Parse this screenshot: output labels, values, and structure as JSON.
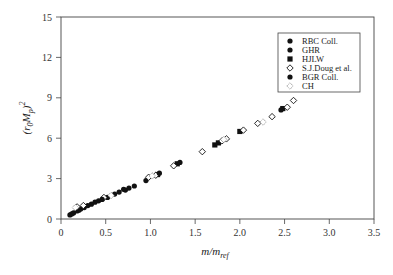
{
  "chart_data": {
    "type": "scatter",
    "title": "",
    "xlabel": "m/m_ref",
    "ylabel": "(r0 Mp)^2",
    "xlim": [
      0,
      3.5
    ],
    "ylim": [
      0,
      15
    ],
    "x_ticks": [
      "0",
      "0.5",
      "1.0",
      "1.5",
      "2.0",
      "2.5",
      "3.0",
      "3.5"
    ],
    "y_ticks": [
      "0",
      "3",
      "6",
      "9",
      "12",
      "15"
    ],
    "grid": false,
    "legend_position": "upper right",
    "series": [
      {
        "name": "RBC Coll.",
        "marker": "filled-circle",
        "color": "#111111",
        "points": [
          [
            0.1,
            0.3
          ],
          [
            0.14,
            0.45
          ],
          [
            0.18,
            0.6
          ],
          [
            0.22,
            0.75
          ],
          [
            0.3,
            1.0
          ],
          [
            0.42,
            1.35
          ],
          [
            0.6,
            1.85
          ],
          [
            0.72,
            2.15
          ],
          [
            0.82,
            2.45
          ],
          [
            0.95,
            2.85
          ]
        ]
      },
      {
        "name": "GHR",
        "marker": "filled-circle",
        "color": "#111111",
        "points": [
          [
            0.12,
            0.38
          ],
          [
            0.2,
            0.65
          ],
          [
            0.26,
            0.85
          ],
          [
            0.38,
            1.25
          ],
          [
            0.52,
            1.6
          ],
          [
            0.65,
            2.0
          ],
          [
            0.76,
            2.3
          ]
        ]
      },
      {
        "name": "HJLW",
        "marker": "filled-square",
        "color": "#111111",
        "points": [
          [
            1.08,
            3.3
          ],
          [
            1.3,
            4.1
          ],
          [
            1.72,
            5.5
          ],
          [
            1.76,
            5.65
          ],
          [
            2.0,
            6.5
          ],
          [
            2.48,
            8.2
          ]
        ]
      },
      {
        "name": "S.J.Doug et al.",
        "marker": "open-diamond",
        "color": "#111111",
        "points": [
          [
            0.18,
            0.9
          ],
          [
            0.25,
            1.0
          ],
          [
            0.48,
            1.6
          ],
          [
            0.98,
            3.1
          ],
          [
            1.06,
            3.25
          ],
          [
            1.26,
            3.95
          ],
          [
            1.58,
            5.0
          ],
          [
            1.8,
            5.8
          ],
          [
            1.85,
            5.95
          ],
          [
            2.04,
            6.6
          ],
          [
            2.2,
            7.1
          ],
          [
            2.36,
            7.6
          ],
          [
            2.53,
            8.3
          ],
          [
            2.6,
            8.8
          ]
        ]
      },
      {
        "name": "BGR Coll.",
        "marker": "filled-circle",
        "color": "#111111",
        "points": [
          [
            0.34,
            1.1
          ],
          [
            0.46,
            1.45
          ],
          [
            0.7,
            2.2
          ],
          [
            1.1,
            3.4
          ],
          [
            1.33,
            4.2
          ],
          [
            2.46,
            8.1
          ]
        ]
      },
      {
        "name": "CH",
        "marker": "open-diamond-dotted",
        "color": "#777777",
        "points": [
          [
            0.16,
            0.85
          ],
          [
            0.56,
            1.75
          ],
          [
            1.02,
            3.2
          ],
          [
            1.82,
            5.9
          ],
          [
            2.26,
            7.2
          ]
        ]
      }
    ]
  },
  "legend": {
    "items": [
      {
        "label": "RBC Coll.",
        "marker": "filled-circle"
      },
      {
        "label": "GHR",
        "marker": "filled-circle"
      },
      {
        "label": "HJLW",
        "marker": "filled-square"
      },
      {
        "label": "S.J.Doug et al.",
        "marker": "open-diamond"
      },
      {
        "label": "BGR Coll.",
        "marker": "filled-circle"
      },
      {
        "label": "CH",
        "marker": "open-diamond-dotted"
      }
    ]
  },
  "axes": {
    "x_title_main": "m/m",
    "x_title_sub": "ref",
    "y_title_main": "(r",
    "y_title_sub0": "0",
    "y_title_mid": "M",
    "y_title_sub1": "p",
    "y_title_end": ")",
    "y_title_sup": "2"
  }
}
